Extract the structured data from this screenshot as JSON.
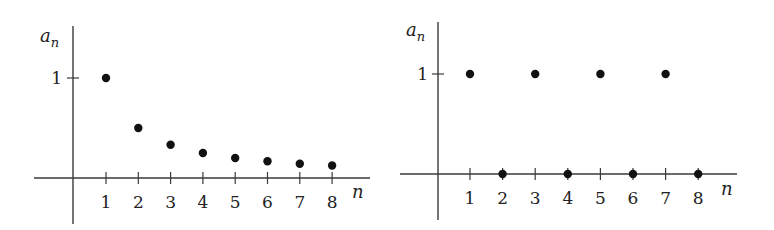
{
  "chart_data": [
    {
      "type": "scatter",
      "title": "",
      "xlabel": "n",
      "ylabel": "a_n",
      "x_ticks": [
        "1",
        "2",
        "3",
        "4",
        "5",
        "6",
        "7",
        "8"
      ],
      "y_ticks": [
        "1"
      ],
      "grid": false,
      "legend": null,
      "x": [
        1,
        2,
        3,
        4,
        5,
        6,
        7,
        8
      ],
      "values": [
        1,
        0.5,
        0.333,
        0.25,
        0.2,
        0.167,
        0.143,
        0.125
      ],
      "description": "Decreasing sequence a_n = 1/n"
    },
    {
      "type": "scatter",
      "title": "",
      "xlabel": "n",
      "ylabel": "a_n",
      "x_ticks": [
        "1",
        "2",
        "3",
        "4",
        "5",
        "6",
        "7",
        "8"
      ],
      "y_ticks": [
        "1"
      ],
      "grid": false,
      "legend": null,
      "x": [
        1,
        2,
        3,
        4,
        5,
        6,
        7,
        8
      ],
      "values": [
        1,
        0,
        1,
        0,
        1,
        0,
        1,
        0
      ],
      "description": "Alternating sequence between 1 and 0"
    }
  ],
  "labels": {
    "left": {
      "y_var": "a",
      "y_sub": "n",
      "x_var": "n",
      "y_tick": "1"
    },
    "right": {
      "y_var": "a",
      "y_sub": "n",
      "x_var": "n",
      "y_tick": "1"
    }
  }
}
